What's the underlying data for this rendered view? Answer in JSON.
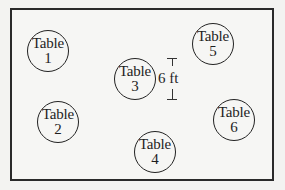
{
  "diagram": {
    "type": "floor-plan",
    "tables": [
      {
        "word": "Table",
        "number": "1",
        "cx": 48,
        "cy": 51
      },
      {
        "word": "Table",
        "number": "2",
        "cx": 58,
        "cy": 122
      },
      {
        "word": "Table",
        "number": "3",
        "cx": 136,
        "cy": 79
      },
      {
        "word": "Table",
        "number": "4",
        "cx": 155,
        "cy": 152
      },
      {
        "word": "Table",
        "number": "5",
        "cx": 213,
        "cy": 44
      },
      {
        "word": "Table",
        "number": "6",
        "cx": 234,
        "cy": 120
      }
    ],
    "dimension": {
      "label": "6 ft",
      "x": 172,
      "top": 57,
      "bottom": 100
    },
    "colors": {
      "line": "#222222",
      "background": "#f3f3f1"
    }
  }
}
